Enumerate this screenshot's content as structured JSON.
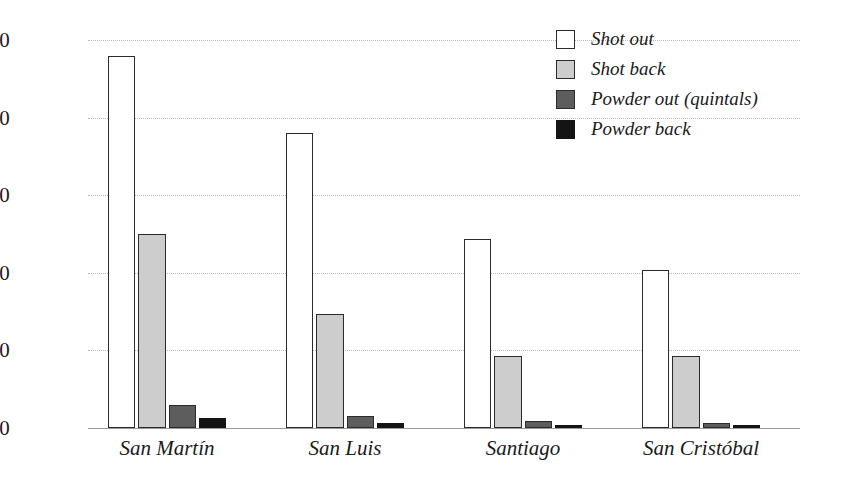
{
  "chart_data": {
    "type": "bar",
    "title": "",
    "subtitle": "",
    "xlabel": "",
    "ylabel": "",
    "ylim": [
      0,
      2500
    ],
    "yticks": [
      "0",
      "500",
      "1,000",
      "1,500",
      "2,000",
      "2,500"
    ],
    "ytick_values": [
      0,
      500,
      1000,
      1500,
      2000,
      2500
    ],
    "grid": true,
    "legend_position": "top-right",
    "categories": [
      "San Martín",
      "San Luis",
      "Santiago",
      "San Cristóbal"
    ],
    "series": [
      {
        "name": "Shot out",
        "color": "#ffffff",
        "values": [
          2400,
          1900,
          1215,
          1015
        ]
      },
      {
        "name": "Shot back",
        "color": "#cdcdcd",
        "values": [
          1250,
          735,
          465,
          465
        ]
      },
      {
        "name": "Powder out (quintals)",
        "color": "#5d5d5d",
        "values": [
          150,
          80,
          45,
          35
        ]
      },
      {
        "name": "Powder back",
        "color": "#141414",
        "values": [
          65,
          30,
          20,
          15
        ]
      }
    ]
  },
  "legend": {
    "items": [
      {
        "label": "Shot out"
      },
      {
        "label": "Shot back"
      },
      {
        "label": "Powder out (quintals)"
      },
      {
        "label": "Powder back"
      }
    ]
  }
}
